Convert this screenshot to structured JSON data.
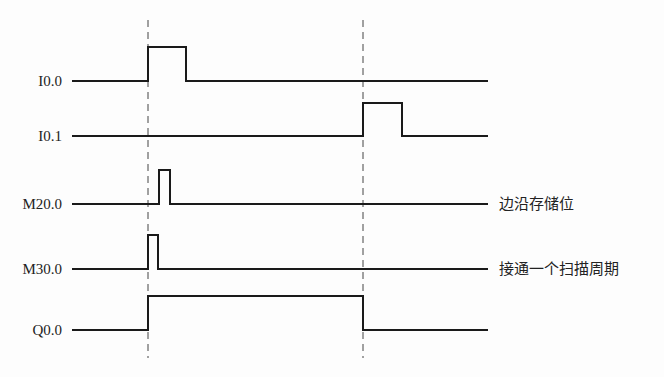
{
  "diagram": {
    "type": "timing-diagram",
    "x_start": 72,
    "x_end": 488,
    "line_color": "#1a1a1a",
    "dashed_markers": [
      {
        "x": 148,
        "y1": 20,
        "y2": 358
      },
      {
        "x": 363,
        "y1": 20,
        "y2": 358
      }
    ],
    "signals": [
      {
        "name": "I0.0",
        "baseline_y": 81,
        "high_y": 47,
        "high_intervals": [
          [
            148,
            186
          ]
        ],
        "annotation": ""
      },
      {
        "name": "I0.1",
        "baseline_y": 136,
        "high_y": 103,
        "high_intervals": [
          [
            363,
            402
          ]
        ],
        "annotation": ""
      },
      {
        "name": "M20.0",
        "baseline_y": 204,
        "high_y": 170,
        "high_intervals": [
          [
            159,
            170
          ]
        ],
        "annotation": "边沿存储位"
      },
      {
        "name": "M30.0",
        "baseline_y": 269,
        "high_y": 235,
        "high_intervals": [
          [
            148,
            158
          ]
        ],
        "annotation": "接通一个扫描周期"
      },
      {
        "name": "Q0.0",
        "baseline_y": 330,
        "high_y": 296,
        "high_intervals": [
          [
            148,
            363
          ]
        ],
        "annotation": ""
      }
    ]
  },
  "labels": {
    "s0": "I0.0",
    "s1": "I0.1",
    "s2": "M20.0",
    "s3": "M30.0",
    "s4": "Q0.0",
    "note_m20": "边沿存储位",
    "note_m30": "接通一个扫描周期"
  }
}
